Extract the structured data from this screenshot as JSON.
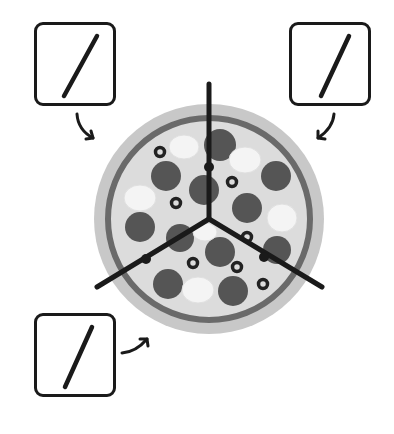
{
  "diagram": {
    "slices": 3,
    "boxes": [
      {
        "id": "top-left",
        "symbol": "/",
        "x": 34,
        "y": 22,
        "arrow": "down-right"
      },
      {
        "id": "top-right",
        "symbol": "/",
        "x": 292,
        "y": 22,
        "arrow": "down-left"
      },
      {
        "id": "bottom-left",
        "symbol": "/",
        "x": 34,
        "y": 313,
        "arrow": "up-right"
      }
    ],
    "pizza": {
      "center": [
        209,
        219
      ],
      "crust_radius": 115,
      "sauce_ring_radius": 100,
      "cut_lines": 3,
      "toppings": [
        "pepperoni",
        "mushroom",
        "olive"
      ]
    },
    "colors": {
      "outline": "#1a1a1a",
      "crust": "#c8c8c8",
      "sauce_ring": "#6a6a6a",
      "cheese": "#dcdcdc",
      "pepperoni": "#555555",
      "mushroom": "#f4f4f4",
      "olive": "#222222"
    }
  }
}
